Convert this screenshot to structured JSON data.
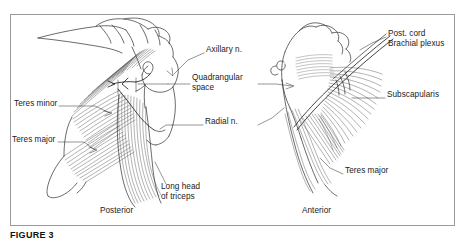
{
  "figure": {
    "caption": "FIGURE 3",
    "frame_border_color": "#9a9a9a",
    "ink_color": "#3a3a3a",
    "background_color": "#ffffff"
  },
  "panels": [
    {
      "id": "left",
      "view_label": "Posterior"
    },
    {
      "id": "right",
      "view_label": "Anterior"
    }
  ],
  "labels": [
    {
      "name": "teres-minor",
      "text": "Teres minor",
      "x": 14,
      "y": 103,
      "align": "left"
    },
    {
      "name": "teres-major-left",
      "text": "Teres major",
      "x": 12,
      "y": 139,
      "align": "left"
    },
    {
      "name": "axillary-nerve",
      "text": "Axillary n.",
      "x": 206,
      "y": 49,
      "align": "left"
    },
    {
      "name": "quadrangular-space",
      "text": "Quadrangular\nspace",
      "x": 192,
      "y": 77,
      "align": "left"
    },
    {
      "name": "radial-nerve",
      "text": "Radial n.",
      "x": 205,
      "y": 121,
      "align": "left"
    },
    {
      "name": "post-cord-brachial-plexus",
      "text": "Post. cord\nBrachial plexus",
      "x": 388,
      "y": 33,
      "align": "left"
    },
    {
      "name": "subscapularis",
      "text": "Subscapularis",
      "x": 387,
      "y": 94,
      "align": "left"
    },
    {
      "name": "teres-major-right",
      "text": "Teres major",
      "x": 345,
      "y": 170,
      "align": "left"
    },
    {
      "name": "long-head-of-triceps",
      "text": "Long head\nof triceps",
      "x": 161,
      "y": 186,
      "align": "left"
    },
    {
      "name": "posterior-view",
      "text": "Posterior",
      "x": 100,
      "y": 210,
      "align": "left"
    },
    {
      "name": "anterior-view",
      "text": "Anterior",
      "x": 302,
      "y": 210,
      "align": "left"
    }
  ]
}
